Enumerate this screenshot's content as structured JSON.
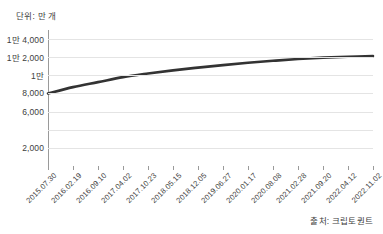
{
  "unit_caption": "단위: 만 개",
  "source_note": "출처: 크립토퀀트",
  "chart_data": {
    "type": "line",
    "title": "",
    "subtitle": "",
    "xlabel": "",
    "ylabel": "",
    "unit_caption": "단위: 만 개",
    "source": "출처: 크립토퀀트",
    "grid": "horizontal-only",
    "legend": "none",
    "line_color": "#333333",
    "grid_color": "#e4e4e4",
    "axis_color": "#9a9a9a",
    "ylim": [
      0,
      15000
    ],
    "ytick_values": [
      14000,
      12000,
      10000,
      8000,
      6000,
      4000,
      2000
    ],
    "ytick_labels": [
      "1만 4,000",
      "1만 2,000",
      "1만",
      "8,000",
      "6,000",
      "",
      "2,000"
    ],
    "categories": [
      "2015.07.30",
      "2016.02.19",
      "2016.09.10",
      "2017.04.02",
      "2017.10.23",
      "2018.05.15",
      "2018.12.05",
      "2019.06.27",
      "2020.01.17",
      "2020.08.08",
      "2021.02.28",
      "2021.09.20",
      "2022.04.12",
      "2022.11.02"
    ],
    "xtick_labels": [
      "2015.07.30",
      "2016.02.19",
      "2016.09.10",
      "2017.04.02",
      "2017.10.23",
      "2018.05.15",
      "2018.12.05",
      "2019.06.27",
      "2020.01.17",
      "2020.08.08",
      "2021.02.28",
      "2021.09.20",
      "2022.04.12",
      "2022.11.02"
    ],
    "values": [
      8000,
      8700,
      9250,
      9800,
      10200,
      10550,
      10850,
      11130,
      11380,
      11600,
      11800,
      11950,
      12050,
      12120
    ],
    "series": [
      {
        "name": "누적 발행량",
        "color": "#333333",
        "values": [
          8000,
          8700,
          9250,
          9800,
          10200,
          10550,
          10850,
          11130,
          11380,
          11600,
          11800,
          11950,
          12050,
          12120
        ]
      }
    ]
  }
}
